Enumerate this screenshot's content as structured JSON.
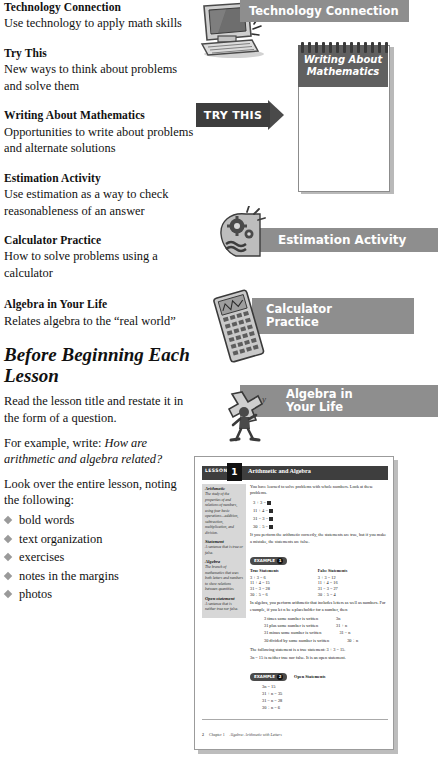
{
  "features": [
    {
      "title": "Technology Connection",
      "desc": "Use technology to apply math skills"
    },
    {
      "title": "Try This",
      "desc": "New ways to think about problems and solve them"
    },
    {
      "title": "Writing About Mathematics",
      "desc": "Opportunities to write about problems and alternate solutions"
    },
    {
      "title": "Estimation Activity",
      "desc": "Use estimation as a way to check reasonableness of an answer"
    },
    {
      "title": "Calculator Practice",
      "desc": "How to solve problems using a calculator"
    },
    {
      "title": "Algebra in Your Life",
      "desc": "Relates algebra to the “real world”"
    }
  ],
  "before_lesson": {
    "heading": "Before Beginning Each Lesson",
    "para1": "Read the lesson title and restate it in the form of a question.",
    "para2_prefix": "For example, write: ",
    "para2_italic": "How are arithmetic and algebra related?",
    "para3": "Look over the entire lesson, noting the following:",
    "bullets": [
      "bold words",
      "text organization",
      "exercises",
      "notes in the margins",
      "photos"
    ]
  },
  "badges": {
    "technology": "Technology Connection",
    "try_this": "TRY THIS",
    "notepad_line1": "Writing About",
    "notepad_line2": "Mathematics",
    "estimation": "Estimation Activity",
    "calculator_line1": "Calculator",
    "calculator_line2": "Practice",
    "algebra_line1": "Algebra in",
    "algebra_line2": "Your Life"
  },
  "book": {
    "lesson_word": "LESSON",
    "lesson_number": "1",
    "lesson_title": "Arithmetic and Algebra",
    "sidebar": [
      {
        "term": "Arithmetic",
        "def": "The study of the properties of and relations of numbers, using four basic operations—addition, subtraction, multiplication, and division."
      },
      {
        "term": "Statement",
        "def": "A sentence that is true or false."
      },
      {
        "term": "Algebra",
        "def": "The branch of mathematics that uses both letters and numbers to show relations between quantities."
      },
      {
        "term": "Open statement",
        "def": "A sentence that is neither true nor false."
      }
    ],
    "intro": "You have learned to solve problems with whole numbers. Look at these problems.",
    "equations": [
      "3 + 3 =",
      "11 + 4 =",
      "31 − 3 =",
      "30 ÷ 5 ="
    ],
    "after_eq": "If you perform the arithmetic correctly, the statements are true, but if you make a mistake, the statements are false.",
    "example1_tag": "EXAMPLE",
    "example1_num": "1",
    "tf_header_true": "True Statements",
    "tf_header_false": "False Statements",
    "tf_rows": [
      {
        "t": "3 + 3 = 6",
        "f": "3 + 3 = 12"
      },
      {
        "t": "11 + 4 = 15",
        "f": "11 + 4 = 16"
      },
      {
        "t": "31 − 3 = 28",
        "f": "31 − 3 = 27"
      },
      {
        "t": "30 ÷ 5 = 6",
        "f": "30 ÷ 5 = 4"
      }
    ],
    "algebra_para": "In algebra, you perform arithmetic that includes letters as well as numbers. For example, if you let n be a placeholder for a number, then",
    "phrases": [
      {
        "text": "3 times some number is written",
        "val": "3n"
      },
      {
        "text": "31 plus some number is written",
        "val": "31 + n"
      },
      {
        "text": "31 minus some number is written",
        "val": "31 − n"
      },
      {
        "text": "30 divided by some number is written",
        "val": "30 ÷ n"
      }
    ],
    "open_para_1": "The following statement is a true statement: 3 + 3 = 15.",
    "open_para_2": "3n = 15 is neither true nor false. It is an open statement.",
    "example2_tag": "EXAMPLE",
    "example2_num": "2",
    "open_header": "Open Statements",
    "open_list": [
      "3n = 15",
      "31 + n = 35",
      "31 − n = 28",
      "30 ÷ n = 6"
    ],
    "footer_page": "2",
    "footer_chapter": "Chapter 1",
    "footer_title": "Algebra: Arithmetic with Letters"
  }
}
